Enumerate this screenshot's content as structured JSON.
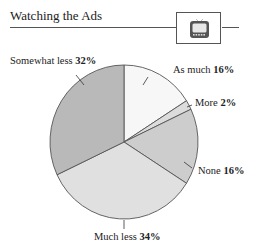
{
  "header": {
    "title": "Watching the Ads",
    "icon": "television-icon"
  },
  "colors": {
    "somewhat_less": "#b9b9b9",
    "much_less": "#e0e0e0",
    "none": "#cdcdcd",
    "as_much": "#f7f7f7",
    "more": "#dcdcdc",
    "outline": "#555555"
  },
  "labels": {
    "as_much": {
      "name": "As much",
      "value": "16%"
    },
    "more": {
      "name": "More",
      "value": "2%"
    },
    "none": {
      "name": "None",
      "value": "16%"
    },
    "much_less": {
      "name": "Much less",
      "value": "34%"
    },
    "somewhat_less": {
      "name": "Somewhat less",
      "value": "32%"
    }
  },
  "chart_data": {
    "type": "pie",
    "title": "Watching the Ads",
    "categories": [
      "As much",
      "More",
      "None",
      "Much less",
      "Somewhat less"
    ],
    "values": [
      16,
      2,
      16,
      34,
      32
    ],
    "units": "%",
    "start_angle": "12 o'clock",
    "direction": "clockwise",
    "legend": "none (direct labels)"
  }
}
